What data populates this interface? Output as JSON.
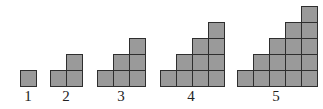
{
  "diagram": {
    "cell_size_px": 16,
    "baseline_y": 86,
    "figures": [
      {
        "label": "1",
        "steps": 1,
        "left": 20,
        "squares": 1
      },
      {
        "label": "2",
        "steps": 2,
        "left": 50,
        "squares": 3
      },
      {
        "label": "3",
        "steps": 3,
        "left": 97,
        "squares": 6
      },
      {
        "label": "4",
        "steps": 4,
        "left": 160,
        "squares": 10
      },
      {
        "label": "5",
        "steps": 5,
        "left": 237,
        "squares": 15
      }
    ],
    "colors": {
      "fill": "#9a9a9a",
      "stroke": "#2e2e2e",
      "background": "#ffffff"
    }
  }
}
